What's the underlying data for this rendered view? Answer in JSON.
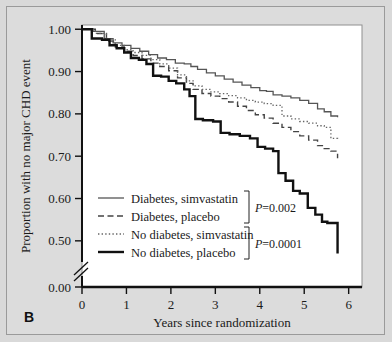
{
  "figure": {
    "panel_label": "B",
    "background_color": "#d9d9d9",
    "plot_background_color": "#ffffff"
  },
  "chart_data": {
    "type": "line",
    "title": "",
    "subtitle": "",
    "xlabel": "Years since randomization",
    "ylabel": "Proportion with no major CHD event",
    "xlim": [
      0,
      6.3
    ],
    "ylim": [
      0.45,
      1.01
    ],
    "xticks": [
      0,
      1,
      2,
      3,
      4,
      5,
      6
    ],
    "xtick_labels": [
      "0",
      "1",
      "2",
      "3",
      "4",
      "5",
      "6"
    ],
    "yticks": [
      0.5,
      0.6,
      0.7,
      0.8,
      0.9,
      1.0
    ],
    "ytick_labels": [
      "0.50",
      "0.60",
      "0.70",
      "0.80",
      "0.90",
      "1.00"
    ],
    "y_axis_break": true,
    "y_axis_break_label": "0.00",
    "grid": false,
    "legend_position": "lower-left-inside",
    "step_plot": true,
    "annotations": [
      {
        "text": "P=0.002",
        "italic_prefix": "P",
        "rest": "=0.002",
        "groups": [
          "Diabetes, simvastatin",
          "Diabetes, placebo"
        ]
      },
      {
        "text": "P=0.0001",
        "italic_prefix": "P",
        "rest": "=0.0001",
        "groups": [
          "No diabetes, simvastatin",
          "No diabetes, placebo"
        ]
      }
    ],
    "series": [
      {
        "name": "Diabetes, simvastatin",
        "style": "solid-thin",
        "color": "#555555",
        "width": 1.3,
        "x": [
          0,
          0.25,
          0.5,
          0.7,
          0.9,
          1.1,
          1.3,
          1.5,
          1.7,
          1.9,
          2.1,
          2.3,
          2.45,
          2.6,
          2.8,
          3.0,
          3.2,
          3.4,
          3.6,
          3.8,
          4.0,
          4.15,
          4.3,
          4.5,
          4.7,
          4.9,
          5.1,
          5.3,
          5.45,
          5.6,
          5.75
        ],
        "y": [
          1.0,
          0.995,
          0.978,
          0.968,
          0.962,
          0.955,
          0.948,
          0.94,
          0.932,
          0.928,
          0.92,
          0.918,
          0.912,
          0.905,
          0.897,
          0.89,
          0.882,
          0.875,
          0.868,
          0.862,
          0.855,
          0.853,
          0.845,
          0.842,
          0.838,
          0.832,
          0.825,
          0.812,
          0.805,
          0.795,
          0.792
        ]
      },
      {
        "name": "Diabetes, placebo",
        "style": "dashed",
        "color": "#444444",
        "width": 1.4,
        "x": [
          0,
          0.3,
          0.55,
          0.75,
          0.95,
          1.15,
          1.35,
          1.55,
          1.75,
          1.95,
          2.15,
          2.35,
          2.5,
          2.7,
          2.9,
          3.1,
          3.3,
          3.5,
          3.7,
          3.9,
          4.1,
          4.3,
          4.5,
          4.7,
          4.9,
          5.1,
          5.3,
          5.45,
          5.6,
          5.75
        ],
        "y": [
          1.0,
          0.99,
          0.972,
          0.958,
          0.948,
          0.938,
          0.93,
          0.92,
          0.912,
          0.902,
          0.885,
          0.872,
          0.858,
          0.848,
          0.842,
          0.836,
          0.828,
          0.818,
          0.808,
          0.798,
          0.79,
          0.778,
          0.768,
          0.758,
          0.748,
          0.738,
          0.725,
          0.718,
          0.712,
          0.695
        ]
      },
      {
        "name": "No diabetes, simvastatin",
        "style": "dotted",
        "color": "#666666",
        "width": 1.3,
        "x": [
          0,
          0.3,
          0.55,
          0.75,
          0.95,
          1.15,
          1.35,
          1.55,
          1.75,
          1.95,
          2.15,
          2.35,
          2.5,
          2.7,
          2.9,
          3.1,
          3.3,
          3.5,
          3.7,
          3.9,
          4.1,
          4.3,
          4.5,
          4.7,
          4.9,
          5.1,
          5.3,
          5.45,
          5.6,
          5.75
        ],
        "y": [
          1.0,
          0.99,
          0.975,
          0.962,
          0.952,
          0.945,
          0.938,
          0.928,
          0.918,
          0.908,
          0.892,
          0.878,
          0.866,
          0.858,
          0.852,
          0.848,
          0.843,
          0.838,
          0.832,
          0.828,
          0.824,
          0.82,
          0.795,
          0.788,
          0.782,
          0.778,
          0.772,
          0.768,
          0.742,
          0.738
        ]
      },
      {
        "name": "No diabetes, placebo",
        "style": "solid-thick",
        "color": "#111111",
        "width": 2.4,
        "x": [
          0,
          0.22,
          0.45,
          0.62,
          0.78,
          0.95,
          1.1,
          1.28,
          1.45,
          1.6,
          1.78,
          1.95,
          2.12,
          2.3,
          2.42,
          2.55,
          2.72,
          2.95,
          3.12,
          3.32,
          3.55,
          3.78,
          3.95,
          4.12,
          4.3,
          4.42,
          4.58,
          4.75,
          4.9,
          5.08,
          5.25,
          5.4,
          5.52,
          5.75
        ],
        "y": [
          1.0,
          0.978,
          0.975,
          0.962,
          0.955,
          0.945,
          0.932,
          0.928,
          0.918,
          0.89,
          0.888,
          0.878,
          0.872,
          0.858,
          0.842,
          0.788,
          0.785,
          0.782,
          0.755,
          0.752,
          0.748,
          0.742,
          0.722,
          0.718,
          0.712,
          0.66,
          0.642,
          0.618,
          0.612,
          0.578,
          0.562,
          0.545,
          0.542,
          0.47
        ]
      }
    ]
  },
  "legend": {
    "entries": [
      {
        "label": "Diabetes, simvastatin",
        "style": "solid-thin"
      },
      {
        "label": "Diabetes, placebo",
        "style": "dashed"
      },
      {
        "label": "No diabetes, simvastatin",
        "style": "dotted"
      },
      {
        "label": "No diabetes, placebo",
        "style": "solid-thick"
      }
    ],
    "pvalues": [
      "P=0.002",
      "P=0.0001"
    ]
  }
}
